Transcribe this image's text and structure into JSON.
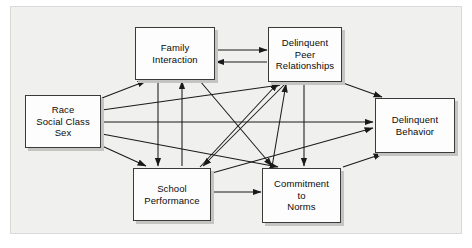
{
  "diagram": {
    "type": "path-model",
    "title": "",
    "background_color": "#f0f0ef",
    "frame_border_color": "#d9d9d7",
    "node_fill": "#fdfdfd",
    "node_border": "#3a3a3a",
    "node_shadow": "#c4c4c2",
    "arrow_color": "#1a1a1a",
    "nodes": [
      {
        "id": "family",
        "label": "Family\nInteraction"
      },
      {
        "id": "peer",
        "label": "Delinquent\nPeer\nRelationships"
      },
      {
        "id": "race",
        "label": "Race\nSocial Class\nSex"
      },
      {
        "id": "behavior",
        "label": "Delinquent\nBehavior"
      },
      {
        "id": "school",
        "label": "School\nPerformance"
      },
      {
        "id": "norms",
        "label": "Commitment\nto\nNorms"
      }
    ],
    "edges": [
      {
        "from": "family",
        "to": "peer",
        "shape": "straight"
      },
      {
        "from": "peer",
        "to": "family",
        "shape": "straight"
      },
      {
        "from": "race",
        "to": "family",
        "shape": "straight"
      },
      {
        "from": "race",
        "to": "peer",
        "shape": "straight"
      },
      {
        "from": "race",
        "to": "behavior",
        "shape": "straight"
      },
      {
        "from": "race",
        "to": "norms",
        "shape": "straight"
      },
      {
        "from": "race",
        "to": "school",
        "shape": "straight"
      },
      {
        "from": "family",
        "to": "school",
        "shape": "vertical"
      },
      {
        "from": "school",
        "to": "family",
        "shape": "vertical"
      },
      {
        "from": "peer",
        "to": "norms",
        "shape": "vertical"
      },
      {
        "from": "family",
        "to": "norms",
        "shape": "diagonal"
      },
      {
        "from": "school",
        "to": "peer",
        "shape": "diagonal"
      },
      {
        "from": "norms",
        "to": "peer",
        "shape": "diagonal"
      },
      {
        "from": "peer",
        "to": "school",
        "shape": "diagonal"
      },
      {
        "from": "peer",
        "to": "behavior",
        "shape": "diagonal"
      },
      {
        "from": "norms",
        "to": "behavior",
        "shape": "diagonal"
      },
      {
        "from": "school",
        "to": "behavior",
        "shape": "straight"
      },
      {
        "from": "school",
        "to": "norms",
        "shape": "straight"
      }
    ]
  }
}
